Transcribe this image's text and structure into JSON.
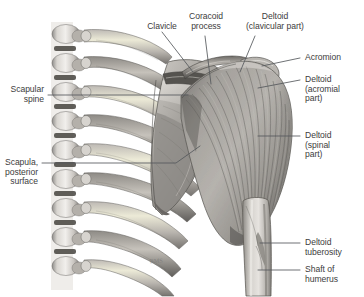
{
  "figure": {
    "background_color": "#ffffff",
    "label_color": "#3d3d3d",
    "leader_color": "#55595c",
    "artist_signature": "RMS"
  },
  "labels": {
    "clavicle": "Clavicle",
    "coracoid_process": "Coracoid\nprocess",
    "deltoid_clavicular": "Deltoid\n(clavicular part)",
    "acromion": "Acromion",
    "deltoid_acromial": "Deltoid\n(acromial\npart)",
    "deltoid_spinal": "Deltoid\n(spinal\npart)",
    "deltoid_tuberosity": "Deltoid\ntuberosity",
    "shaft_of_humerus": "Shaft of\nhumerus",
    "scapular_spine": "Scapular\nspine",
    "scapula_posterior_surface": "Scapula,\nposterior\nsurface"
  },
  "structures": [
    {
      "name": "thoracic-vertebrae",
      "side": "left"
    },
    {
      "name": "ribs",
      "side": "left",
      "count": 9
    },
    {
      "name": "clavicle",
      "side": "center"
    },
    {
      "name": "coracoid-process",
      "side": "center"
    },
    {
      "name": "acromion",
      "side": "right"
    },
    {
      "name": "scapula-posterior-surface",
      "side": "center"
    },
    {
      "name": "scapular-spine",
      "side": "center"
    },
    {
      "name": "deltoid-muscle",
      "side": "right"
    },
    {
      "name": "humerus-shaft",
      "side": "right"
    },
    {
      "name": "deltoid-tuberosity",
      "side": "right"
    }
  ]
}
